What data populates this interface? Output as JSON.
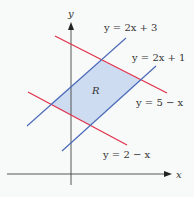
{
  "figure": {
    "type": "region-diagram",
    "region_label": "R",
    "axes": {
      "x_label": "x",
      "y_label": "y"
    },
    "lines": [
      {
        "id": "upper-blue",
        "equation": "y = 2x + 3",
        "color": "#4a6ab8"
      },
      {
        "id": "lower-blue",
        "equation": "y = 2x + 1",
        "color": "#4a6ab8"
      },
      {
        "id": "upper-red",
        "equation": "y = 5 − x",
        "color": "#e0304a"
      },
      {
        "id": "lower-red",
        "equation": "y = 2 − x",
        "color": "#e0304a"
      }
    ],
    "labels": {
      "upper_blue": "y = 2x + 3",
      "lower_blue": "y = 2x + 1",
      "upper_red": "y = 5 − x",
      "lower_red": "y = 2 − x"
    },
    "colors": {
      "red": "#e0304a",
      "blue": "#4a6ab8",
      "region_fill": "#c8d8f0",
      "axis": "#444444",
      "background": "#f8f9f9"
    }
  }
}
